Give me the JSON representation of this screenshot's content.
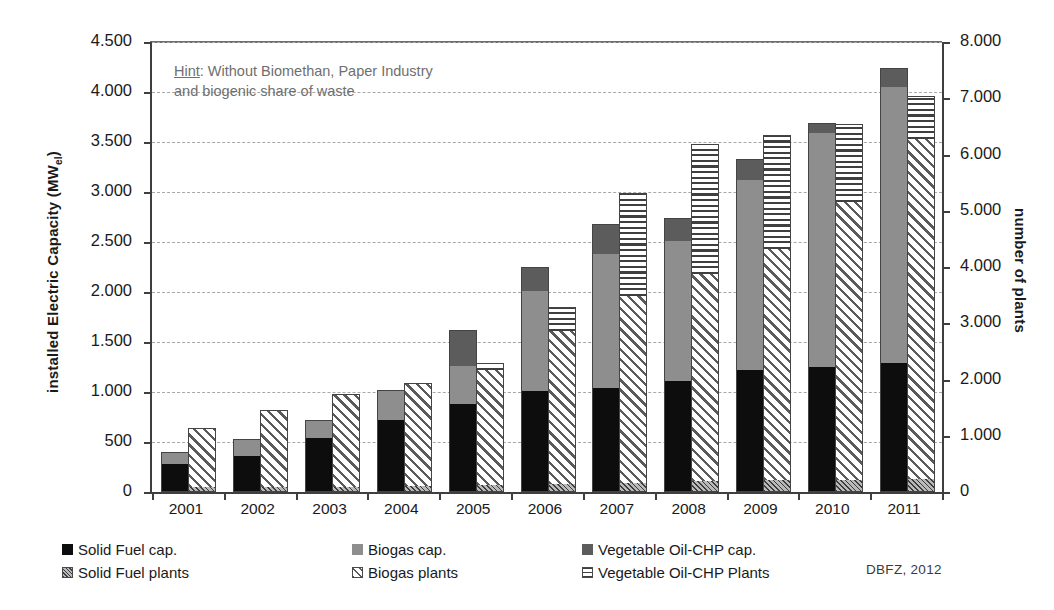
{
  "axes": {
    "left_title_main": "installed  Electric Capacity (MW",
    "left_title_sub": "el",
    "left_title_tail": ")",
    "right_title": "number of plants",
    "left_ticks": [
      "0",
      "500",
      "1.000",
      "1.500",
      "2.000",
      "2.500",
      "3.000",
      "3.500",
      "4.000",
      "4.500"
    ],
    "right_ticks": [
      "0",
      "1.000",
      "2.000",
      "3.000",
      "4.000",
      "5.000",
      "6.000",
      "7.000",
      "8.000"
    ]
  },
  "hint": {
    "label": "Hint",
    "line1_rest": ":  Without Biomethan, Paper Industry",
    "line2": "and biogenic share of waste"
  },
  "legend": {
    "items": [
      {
        "label": "Solid Fuel cap.",
        "swatch": "sw-solid",
        "icon": "solid-fuel-capacity-swatch"
      },
      {
        "label": "Biogas cap.",
        "swatch": "sw-biogas",
        "icon": "biogas-capacity-swatch"
      },
      {
        "label": "Vegetable Oil-CHP cap.",
        "swatch": "sw-vegoil",
        "icon": "vegetable-oil-chp-capacity-swatch"
      },
      {
        "label": "Solid Fuel plants",
        "swatch": "sw-solid-pl",
        "icon": "solid-fuel-plants-swatch"
      },
      {
        "label": "Biogas plants",
        "swatch": "sw-biogas-pl",
        "icon": "biogas-plants-swatch"
      },
      {
        "label": "Vegetable Oil-CHP Plants",
        "swatch": "sw-vegoil-pl",
        "icon": "vegetable-oil-chp-plants-swatch"
      }
    ]
  },
  "source": "DBFZ, 2012",
  "colors": {
    "solid_fuel": "#0d0d0d",
    "biogas": "#8e8e8e",
    "vegetable_oil": "#5c5c5c",
    "axis": "#3f3f3f",
    "grid": "#a8a8a8",
    "hint_text": "#6f6f6f"
  },
  "chart_data": {
    "type": "bar",
    "title": "",
    "subtitle": "",
    "annotation": "Hint:  Without Biomethan, Paper Industry and biogenic share of waste",
    "source": "DBFZ, 2012",
    "stacked": true,
    "grouped": true,
    "grid": true,
    "legend_position": "bottom",
    "xlabel": "",
    "categories": [
      "2001",
      "2002",
      "2003",
      "2004",
      "2005",
      "2006",
      "2007",
      "2008",
      "2009",
      "2010",
      "2011"
    ],
    "left_axis": {
      "ylabel": "installed  Electric Capacity (MWel)",
      "ylim": [
        0,
        4500
      ],
      "ytick_step": 500,
      "unit": "MWel"
    },
    "right_axis": {
      "ylabel": "number of plants",
      "ylim": [
        0,
        8000
      ],
      "ytick_step": 1000,
      "unit": "plants"
    },
    "series": [
      {
        "name": "Solid Fuel cap.",
        "axis": "left",
        "stack": "capacity",
        "values": [
          270,
          350,
          530,
          710,
          870,
          1000,
          1030,
          1100,
          1210,
          1240,
          1280
        ]
      },
      {
        "name": "Biogas cap.",
        "axis": "left",
        "stack": "capacity",
        "values": [
          110,
          160,
          175,
          290,
          380,
          1000,
          1340,
          1400,
          1900,
          2340,
          2760
        ]
      },
      {
        "name": "Vegetable Oil-CHP cap.",
        "axis": "left",
        "stack": "capacity",
        "values": [
          0,
          0,
          0,
          0,
          350,
          230,
          290,
          220,
          200,
          90,
          180
        ]
      },
      {
        "name": "Solid Fuel plants",
        "axis": "right",
        "stack": "plants",
        "values": [
          70,
          75,
          80,
          90,
          100,
          120,
          150,
          170,
          190,
          200,
          210
        ]
      },
      {
        "name": "Biogas plants",
        "axis": "right",
        "stack": "plants",
        "values": [
          1030,
          1345,
          1620,
          1810,
          2050,
          2730,
          3310,
          3680,
          4120,
          4930,
          6040
        ]
      },
      {
        "name": "Vegetable Oil-CHP Plants",
        "axis": "right",
        "stack": "plants",
        "values": [
          0,
          0,
          0,
          0,
          100,
          400,
          1820,
          2310,
          2010,
          1380,
          750
        ]
      }
    ],
    "totals": {
      "capacity_MWel": [
        380,
        510,
        705,
        1000,
        1600,
        2230,
        2660,
        2720,
        3310,
        3670,
        4220
      ],
      "plants": [
        1100,
        1420,
        1700,
        1900,
        2250,
        3250,
        5280,
        6160,
        6320,
        6510,
        7000
      ]
    }
  }
}
